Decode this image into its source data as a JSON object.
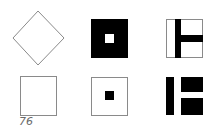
{
  "figure": {
    "label": "76",
    "colors": {
      "background": "#ffffff",
      "fill": "#000000",
      "stroke": "#8a8a8a"
    },
    "shapes": [
      {
        "row": 1,
        "col": 1,
        "name": "diamond-outline",
        "description": "Outlined square rotated 45 degrees (diamond)"
      },
      {
        "row": 1,
        "col": 2,
        "name": "black-square-white-center",
        "description": "Solid black square with small white square in center"
      },
      {
        "row": 1,
        "col": 3,
        "name": "square-with-t-bars",
        "description": "Outlined square with black vertical bar left of center and black horizontal bar extending to right edge"
      },
      {
        "row": 2,
        "col": 1,
        "name": "square-outline",
        "description": "Plain outlined square"
      },
      {
        "row": 2,
        "col": 2,
        "name": "square-outline-black-center",
        "description": "Outlined square with small black square in center"
      },
      {
        "row": 2,
        "col": 3,
        "name": "bar-and-two-blocks",
        "description": "Black vertical bar with two stacked black rectangles to its right"
      }
    ]
  }
}
